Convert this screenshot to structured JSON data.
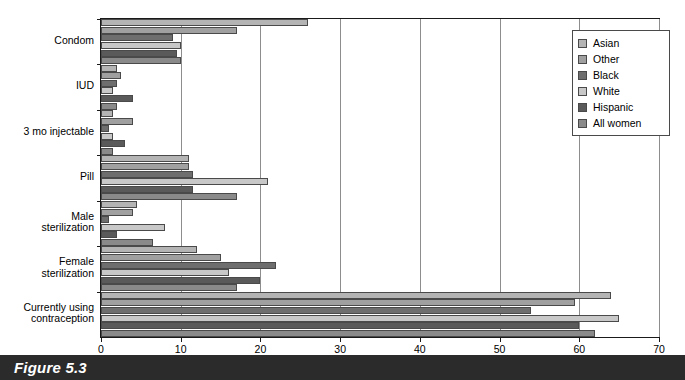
{
  "caption": {
    "label": "Figure 5.3"
  },
  "legend": {
    "position": "top-right",
    "items": [
      {
        "label": "Asian",
        "color": "#b4b4b4"
      },
      {
        "label": "Other",
        "color": "#a0a0a0"
      },
      {
        "label": "Black",
        "color": "#6e6e6e"
      },
      {
        "label": "White",
        "color": "#c8c8c8"
      },
      {
        "label": "Hispanic",
        "color": "#5a5a5a"
      },
      {
        "label": "All women",
        "color": "#8a8a8a"
      }
    ]
  },
  "axes": {
    "x": {
      "label": "",
      "min": 0,
      "max": 70,
      "step": 10,
      "ticks": [
        "0",
        "10",
        "20",
        "30",
        "40",
        "50",
        "60",
        "70"
      ],
      "grid": true
    },
    "y": {
      "label": "",
      "categories": [
        "Condom",
        "IUD",
        "3 mo injectable",
        "Pill",
        "Male\nsterilization",
        "Female\nsterilization",
        "Currently using\ncontraception"
      ]
    }
  },
  "chart_data": {
    "type": "bar",
    "orientation": "horizontal",
    "title": "Figure 5.3",
    "xlabel": "",
    "ylabel": "",
    "xlim": [
      0,
      70
    ],
    "grid": true,
    "legend_position": "top-right",
    "categories": [
      "Condom",
      "IUD",
      "3 mo injectable",
      "Pill",
      "Male sterilization",
      "Female sterilization",
      "Currently using contraception"
    ],
    "series": [
      {
        "name": "Asian",
        "color": "#b4b4b4",
        "values": [
          26.0,
          2.0,
          1.5,
          11.0,
          4.5,
          12.0,
          64.0
        ]
      },
      {
        "name": "Other",
        "color": "#a0a0a0",
        "values": [
          17.0,
          2.5,
          4.0,
          11.0,
          4.0,
          15.0,
          59.5
        ]
      },
      {
        "name": "Black",
        "color": "#6e6e6e",
        "values": [
          9.0,
          2.0,
          1.0,
          11.5,
          1.0,
          22.0,
          54.0
        ]
      },
      {
        "name": "White",
        "color": "#c8c8c8",
        "values": [
          10.0,
          1.5,
          1.5,
          21.0,
          8.0,
          16.0,
          65.0
        ]
      },
      {
        "name": "Hispanic",
        "color": "#5a5a5a",
        "values": [
          9.5,
          4.0,
          3.0,
          11.5,
          2.0,
          20.0,
          60.0
        ]
      },
      {
        "name": "All women",
        "color": "#8a8a8a",
        "values": [
          10.0,
          2.0,
          1.5,
          17.0,
          6.5,
          17.0,
          62.0
        ]
      }
    ]
  }
}
